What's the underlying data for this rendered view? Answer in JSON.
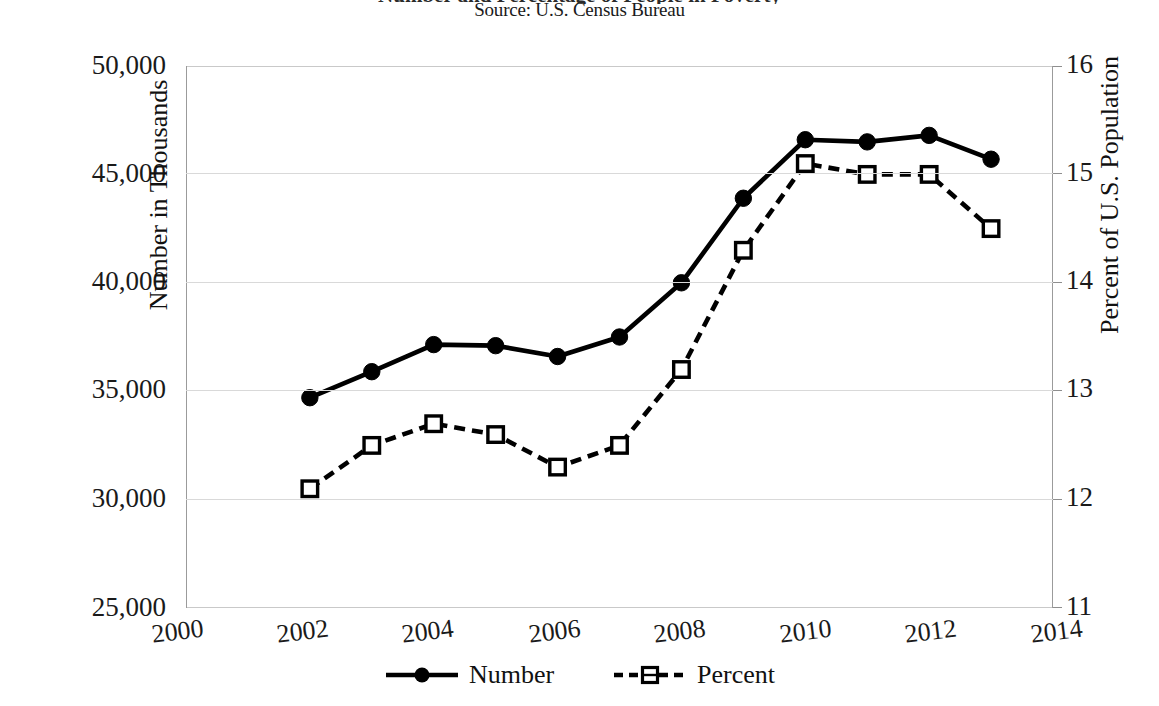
{
  "title_fragment": "Number and Percentage of People in Poverty",
  "source": "Source: U.S. Census Bureau",
  "axes": {
    "left_title": "Number in Thousands",
    "right_title": "Percent of U.S. Population",
    "left_ticks": [
      "50,000",
      "45,000",
      "40,000",
      "35,000",
      "30,000",
      "25,000"
    ],
    "right_ticks": [
      "16",
      "15",
      "14",
      "13",
      "12",
      "11"
    ],
    "x_ticks": [
      "2000",
      "2002",
      "2004",
      "2006",
      "2008",
      "2010",
      "2012",
      "2014"
    ]
  },
  "legend": {
    "items": [
      {
        "label": "Number",
        "style": "solid-line-filled-circle",
        "color": "#000000"
      },
      {
        "label": "Percent",
        "style": "dashed-line-open-square",
        "color": "#000000"
      }
    ]
  },
  "chart_data": {
    "type": "line",
    "title": "Number and Percentage of People in Poverty",
    "subtitle": "Source: U.S. Census Bureau",
    "xlabel": "",
    "ylabel": "Number in Thousands",
    "y2label": "Percent of U.S. Population",
    "x": [
      2002,
      2003,
      2004,
      2005,
      2006,
      2007,
      2008,
      2009,
      2010,
      2011,
      2012,
      2013
    ],
    "xlim": [
      2000,
      2014
    ],
    "ylim": [
      25000,
      50000
    ],
    "y2lim": [
      11,
      16
    ],
    "ytick_step": 5000,
    "y2tick_step": 1,
    "xtick_step": 2,
    "grid": true,
    "legend_position": "bottom",
    "series": [
      {
        "name": "Number",
        "axis": "left",
        "line": "solid",
        "marker": "filled-circle",
        "color": "#000000",
        "values": [
          34700,
          35900,
          37150,
          37100,
          36600,
          37500,
          40000,
          43900,
          46600,
          46500,
          46800,
          45700
        ]
      },
      {
        "name": "Percent",
        "axis": "right",
        "line": "dashed",
        "marker": "open-square",
        "color": "#000000",
        "values": [
          12.1,
          12.5,
          12.7,
          12.6,
          12.3,
          12.5,
          13.2,
          14.3,
          15.1,
          15.0,
          15.0,
          14.5
        ]
      }
    ]
  }
}
